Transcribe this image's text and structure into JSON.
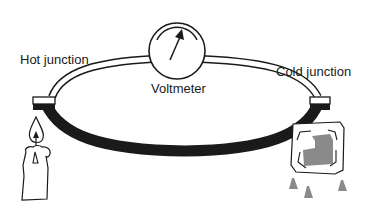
{
  "diagram": {
    "labels": {
      "hot_junction": "Hot junction",
      "voltmeter": "Voltmeter",
      "cold_junction": "Cold junction"
    },
    "components": [
      {
        "name": "voltmeter",
        "shape": "circle-with-needle"
      },
      {
        "name": "upper-wire",
        "style": "hollow double-line tube"
      },
      {
        "name": "lower-wire",
        "style": "solid thick black"
      },
      {
        "name": "hot-junction",
        "heat_source": "candle"
      },
      {
        "name": "cold-junction",
        "cold_source": "melting ice cube"
      }
    ],
    "colors": {
      "line": "#1a1a1a",
      "ice": "#8a8a8a",
      "background": "#ffffff"
    }
  }
}
